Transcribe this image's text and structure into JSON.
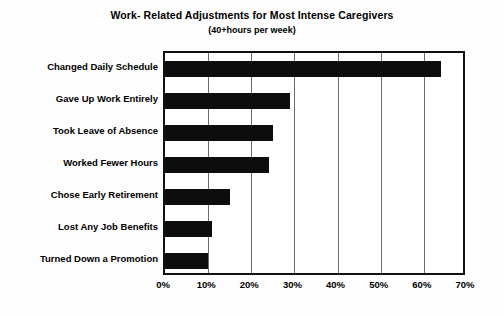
{
  "chart_data": {
    "type": "bar",
    "orientation": "horizontal",
    "title": "Work- Related Adjustments for Most Intense Caregivers",
    "subtitle": "(40+hours per week)",
    "xlabel": "",
    "ylabel": "",
    "xlim": [
      0,
      70
    ],
    "xtick_labels": [
      "0%",
      "10%",
      "20%",
      "30%",
      "40%",
      "50%",
      "60%",
      "70%"
    ],
    "xticks": [
      0,
      10,
      20,
      30,
      40,
      50,
      60,
      70
    ],
    "grid": true,
    "legend": false,
    "bar_color": "#0d0d0d",
    "categories": [
      "Changed Daily Schedule",
      "Gave Up Work Entirely",
      "Took Leave of Absence",
      "Worked Fewer Hours",
      "Chose Early Retirement",
      "Lost Any Job Benefits",
      "Turned Down a Promotion"
    ],
    "values": [
      64,
      29,
      25,
      24,
      15,
      11,
      10
    ]
  }
}
